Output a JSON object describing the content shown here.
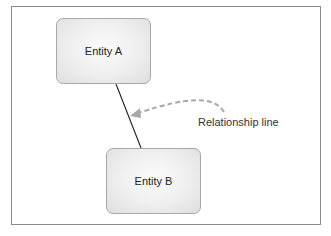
{
  "diagram": {
    "entities": [
      {
        "id": "A",
        "label": "Entity A"
      },
      {
        "id": "B",
        "label": "Entity B"
      }
    ],
    "relationships": [
      {
        "from": "A",
        "to": "B",
        "style": "solid"
      }
    ],
    "annotations": [
      {
        "label": "Relationship line",
        "points_to": "relationship A-B",
        "style": "dashed-curved-arrow",
        "color": "#a8a8a8"
      }
    ]
  }
}
